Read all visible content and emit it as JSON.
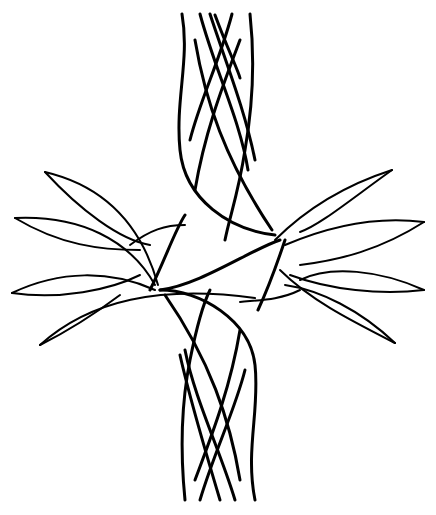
{
  "image": {
    "subject": "Black ink line-art celtic-style cross with interwoven braided ribbons and leaf-shaped loops",
    "background_color": "#ffffff",
    "ink_color": "#000000"
  }
}
